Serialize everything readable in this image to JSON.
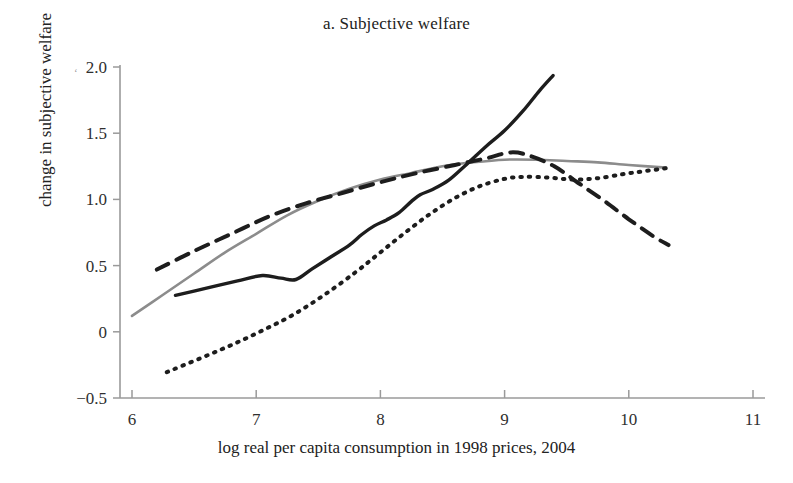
{
  "figure": {
    "title": "a. Subjective welfare",
    "xlabel": "log real per capita consumption in 1998 prices, 2004",
    "ylabel": "change in subjective welfare"
  },
  "axes": {
    "x_ticks": [
      "6",
      "7",
      "8",
      "9",
      "10",
      "11"
    ],
    "y_ticks": [
      "2.0",
      "1.5",
      "1.0",
      "0.5",
      "0",
      "−0.5"
    ]
  },
  "chart_data": {
    "type": "line",
    "title": "a. Subjective welfare",
    "xlabel": "log real per capita consumption in 1998 prices, 2004",
    "ylabel": "change in subjective welfare",
    "xlim": [
      6,
      11
    ],
    "ylim": [
      -0.5,
      2.0
    ],
    "xticks": [
      6,
      7,
      8,
      9,
      10,
      11
    ],
    "yticks": [
      -0.5,
      0,
      0.5,
      1.0,
      1.5,
      2.0
    ],
    "grid": false,
    "legend": "none",
    "series": [
      {
        "name": "gray-solid",
        "style": "solid",
        "color": "#8c8c8c",
        "width": 2.6,
        "points": [
          [
            6.0,
            0.12
          ],
          [
            6.25,
            0.28
          ],
          [
            6.5,
            0.44
          ],
          [
            6.75,
            0.6
          ],
          [
            7.0,
            0.74
          ],
          [
            7.25,
            0.88
          ],
          [
            7.5,
            0.99
          ],
          [
            7.75,
            1.08
          ],
          [
            8.0,
            1.15
          ],
          [
            8.25,
            1.2
          ],
          [
            8.5,
            1.25
          ],
          [
            8.75,
            1.28
          ],
          [
            9.0,
            1.3
          ],
          [
            9.25,
            1.3
          ],
          [
            9.5,
            1.29
          ],
          [
            9.75,
            1.28
          ],
          [
            10.0,
            1.26
          ],
          [
            10.3,
            1.24
          ]
        ]
      },
      {
        "name": "black-dashed",
        "style": "dashed",
        "color": "#1d1d1d",
        "width": 4.0,
        "dash": "13,9",
        "points": [
          [
            6.2,
            0.47
          ],
          [
            6.5,
            0.61
          ],
          [
            6.8,
            0.74
          ],
          [
            7.1,
            0.87
          ],
          [
            7.4,
            0.97
          ],
          [
            7.7,
            1.05
          ],
          [
            8.0,
            1.13
          ],
          [
            8.3,
            1.2
          ],
          [
            8.6,
            1.26
          ],
          [
            8.85,
            1.31
          ],
          [
            9.05,
            1.355
          ],
          [
            9.2,
            1.33
          ],
          [
            9.4,
            1.25
          ],
          [
            9.6,
            1.12
          ],
          [
            9.8,
            0.99
          ],
          [
            10.0,
            0.85
          ],
          [
            10.2,
            0.72
          ],
          [
            10.32,
            0.655
          ]
        ]
      },
      {
        "name": "black-solid",
        "style": "solid",
        "color": "#1d1d1d",
        "width": 3.4,
        "points": [
          [
            6.35,
            0.275
          ],
          [
            6.6,
            0.33
          ],
          [
            6.85,
            0.385
          ],
          [
            7.05,
            0.425
          ],
          [
            7.2,
            0.405
          ],
          [
            7.32,
            0.395
          ],
          [
            7.45,
            0.475
          ],
          [
            7.6,
            0.565
          ],
          [
            7.75,
            0.655
          ],
          [
            7.85,
            0.735
          ],
          [
            7.95,
            0.8
          ],
          [
            8.05,
            0.845
          ],
          [
            8.15,
            0.9
          ],
          [
            8.25,
            0.985
          ],
          [
            8.32,
            1.035
          ],
          [
            8.42,
            1.075
          ],
          [
            8.55,
            1.145
          ],
          [
            8.7,
            1.27
          ],
          [
            8.85,
            1.4
          ],
          [
            9.0,
            1.52
          ],
          [
            9.15,
            1.67
          ],
          [
            9.28,
            1.82
          ],
          [
            9.39,
            1.935
          ]
        ]
      },
      {
        "name": "black-dotted",
        "style": "dotted",
        "color": "#1d1d1d",
        "width": 4.0,
        "dash": "1.5,7",
        "points": [
          [
            6.28,
            -0.305
          ],
          [
            6.55,
            -0.2
          ],
          [
            6.8,
            -0.1
          ],
          [
            7.05,
            0.01
          ],
          [
            7.3,
            0.13
          ],
          [
            7.55,
            0.28
          ],
          [
            7.8,
            0.45
          ],
          [
            8.0,
            0.6
          ],
          [
            8.2,
            0.75
          ],
          [
            8.4,
            0.89
          ],
          [
            8.6,
            1.01
          ],
          [
            8.8,
            1.1
          ],
          [
            9.0,
            1.155
          ],
          [
            9.15,
            1.17
          ],
          [
            9.35,
            1.165
          ],
          [
            9.55,
            1.15
          ],
          [
            9.75,
            1.16
          ],
          [
            9.95,
            1.19
          ],
          [
            10.1,
            1.21
          ],
          [
            10.3,
            1.235
          ]
        ]
      }
    ]
  }
}
